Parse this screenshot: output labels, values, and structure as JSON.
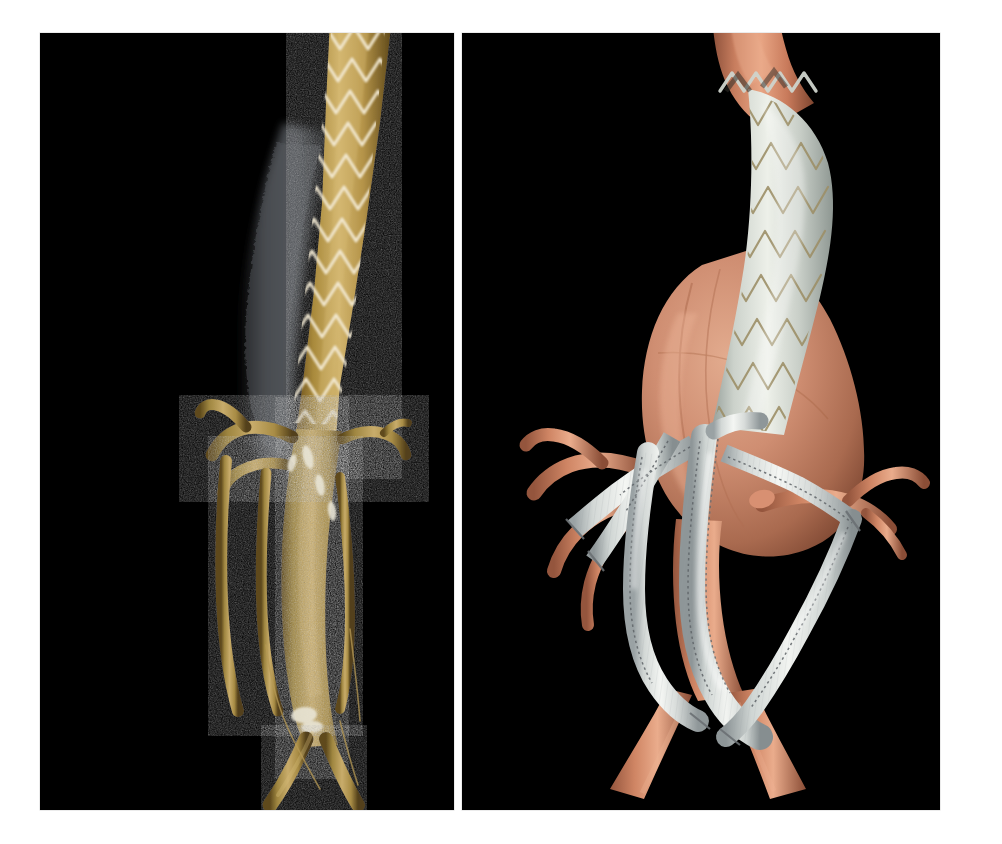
{
  "figure": {
    "margin_credit": "Figure 8",
    "background_color": "#ffffff",
    "panel_background_color": "#000000"
  },
  "panels": [
    {
      "id": "panel-left",
      "name": "ct-angiography-volume-rendering",
      "modality": "CT angiography 3D volume rendering",
      "background_color": "#000000",
      "content_summary": "Thoracoabdominal aorta with endovascular stent graft; zigzag Z-stent wire struts visible over contrast-opacified lumen; mural thrombus; visceral branch vessels and iliac bifurcation below",
      "colors": {
        "vessel_contrast": "#b9933f",
        "vessel_highlight": "#d8bd79",
        "vessel_shadow": "#6f5520",
        "stent_wire": "#efe6cf",
        "thrombus": "#52555a",
        "calcification": "#e8e4d8"
      }
    },
    {
      "id": "panel-right",
      "name": "medical-illustration-visceral-debranching",
      "modality": "Medical illustration",
      "background_color": "#000000",
      "content_summary": "Artist rendering of thoracoabdominal aortic aneurysm with proximal endovascular stent graft and retrograde visceral debranching bypass grafts to celiac, superior mesenteric and both renal arteries; aortoiliac bifurcation at base",
      "colors": {
        "aorta": "#c87b5e",
        "aorta_highlight": "#e6a183",
        "aorta_shadow": "#8d4f3a",
        "aneurysm_sac": "#cf9a80",
        "graft_fabric": "#dfe2df",
        "graft_highlight": "#f6f7f5",
        "graft_shadow": "#9aa0a2",
        "stent_wire": "#a89a72",
        "suture": "#6d7276"
      }
    }
  ]
}
